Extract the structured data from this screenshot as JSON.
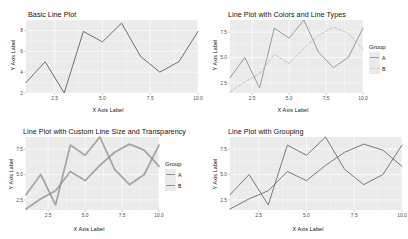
{
  "figure": {
    "background": "#ffffff",
    "panel_background": "#ebebeb",
    "grid_color": "#ffffff",
    "axis_text_color": "#4d4d4d",
    "title_color": "#111111"
  },
  "chart_data": [
    {
      "type": "line",
      "panel": "top-left",
      "title": "Basic Line Plot",
      "xlabel": "X Axis Label",
      "ylabel": "Y Axis Label",
      "xlim": [
        1,
        10
      ],
      "ylim": [
        2,
        9
      ],
      "xticks": [
        "2.5",
        "5.0",
        "7.5",
        "10.0"
      ],
      "xtickvals": [
        2.5,
        5.0,
        7.5,
        10.0
      ],
      "yticks": [
        "2",
        "4",
        "6",
        "8"
      ],
      "ytickvals": [
        2,
        4,
        6,
        8
      ],
      "grid": true,
      "legend": null,
      "line_color": "#6f6f6f",
      "line_width": 1.0,
      "x": [
        1,
        2,
        3,
        4,
        5,
        6,
        7,
        8,
        9,
        10
      ],
      "values": [
        3.0,
        5.0,
        2.0,
        7.9,
        6.9,
        8.7,
        5.5,
        4.0,
        5.0,
        7.9
      ]
    },
    {
      "type": "line",
      "panel": "top-right",
      "title": "Line Plot with Colors and Line Types",
      "xlabel": "X Axis Label",
      "ylabel": "Y Axis Label",
      "xlim": [
        1,
        10
      ],
      "ylim": [
        1.5,
        8.7
      ],
      "xticks": [
        "2.5",
        "5.0",
        "7.5",
        "10.0"
      ],
      "xtickvals": [
        2.5,
        5.0,
        7.5,
        10.0
      ],
      "yticks": [
        "2.5",
        "5.0",
        "7.5"
      ],
      "ytickvals": [
        2.5,
        5.0,
        7.5
      ],
      "grid": true,
      "legend": {
        "title": "Group",
        "position": "right",
        "entries": [
          {
            "label": "A",
            "color": "#9a9a9a",
            "dash": "solid"
          },
          {
            "label": "B",
            "color": "#c4c4c4",
            "dash": "dashed"
          }
        ]
      },
      "series": [
        {
          "name": "A",
          "color": "#9a9a9a",
          "dash": "solid",
          "x": [
            1,
            2,
            3,
            4,
            5,
            6,
            7,
            8,
            9,
            10
          ],
          "values": [
            3.0,
            5.0,
            2.0,
            7.9,
            6.9,
            8.7,
            5.5,
            4.0,
            5.0,
            7.9
          ]
        },
        {
          "name": "B",
          "color": "#c4c4c4",
          "dash": "dashed",
          "x": [
            1,
            2,
            3,
            4,
            5,
            6,
            7,
            8,
            9,
            10
          ],
          "values": [
            1.6,
            2.6,
            3.4,
            5.3,
            4.4,
            5.9,
            7.2,
            8.0,
            7.4,
            5.8
          ]
        }
      ]
    },
    {
      "type": "line",
      "panel": "bottom-left",
      "title": "Line Plot with Custom Line Size and Transparency",
      "xlabel": "X Axis Label",
      "ylabel": "Y Axis Label",
      "xlim": [
        1,
        10
      ],
      "ylim": [
        1.5,
        8.7
      ],
      "xticks": [
        "2.5",
        "5.0",
        "7.5",
        "10.0"
      ],
      "xtickvals": [
        2.5,
        5.0,
        7.5,
        10.0
      ],
      "yticks": [
        "2.5",
        "5.0",
        "7.5"
      ],
      "ytickvals": [
        2.5,
        5.0,
        7.5
      ],
      "grid": true,
      "legend": {
        "title": "Group",
        "position": "right",
        "entries": [
          {
            "label": "A",
            "color": "#8f8f8f",
            "dash": "solid"
          },
          {
            "label": "B",
            "color": "#8f8f8f",
            "dash": "solid"
          }
        ]
      },
      "line_width": 1.8,
      "opacity": 0.75,
      "series": [
        {
          "name": "A",
          "color": "#8f8f8f",
          "dash": "solid",
          "x": [
            1,
            2,
            3,
            4,
            5,
            6,
            7,
            8,
            9,
            10
          ],
          "values": [
            3.0,
            5.0,
            2.0,
            7.9,
            6.9,
            8.7,
            5.5,
            4.0,
            5.0,
            7.9
          ]
        },
        {
          "name": "B",
          "color": "#8f8f8f",
          "dash": "solid",
          "x": [
            1,
            2,
            3,
            4,
            5,
            6,
            7,
            8,
            9,
            10
          ],
          "values": [
            1.6,
            2.6,
            3.4,
            5.3,
            4.4,
            5.9,
            7.2,
            8.0,
            7.4,
            5.8
          ]
        }
      ]
    },
    {
      "type": "line",
      "panel": "bottom-right",
      "title": "Line Plot with Grouping",
      "xlabel": "X Axis Label",
      "ylabel": "Y Axis Label",
      "xlim": [
        1,
        10
      ],
      "ylim": [
        1.5,
        8.7
      ],
      "xticks": [
        "2.5",
        "5.0",
        "7.5",
        "10.0"
      ],
      "xtickvals": [
        2.5,
        5.0,
        7.5,
        10.0
      ],
      "yticks": [
        "2.5",
        "5.0",
        "7.5"
      ],
      "ytickvals": [
        2.5,
        5.0,
        7.5
      ],
      "grid": true,
      "legend": null,
      "line_width": 1.0,
      "series": [
        {
          "name": "A",
          "color": "#7a7a7a",
          "dash": "solid",
          "x": [
            1,
            2,
            3,
            4,
            5,
            6,
            7,
            8,
            9,
            10
          ],
          "values": [
            3.0,
            5.0,
            2.0,
            7.9,
            6.9,
            8.7,
            5.5,
            4.0,
            5.0,
            7.9
          ]
        },
        {
          "name": "B",
          "color": "#7a7a7a",
          "dash": "solid",
          "x": [
            1,
            2,
            3,
            4,
            5,
            6,
            7,
            8,
            9,
            10
          ],
          "values": [
            1.6,
            2.6,
            3.4,
            5.3,
            4.4,
            5.9,
            7.2,
            8.0,
            7.4,
            5.8
          ]
        }
      ]
    }
  ]
}
